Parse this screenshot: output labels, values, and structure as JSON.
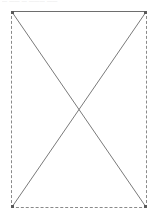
{
  "canvas": {
    "width": 156,
    "height": 218,
    "background_color": "#ffffff"
  },
  "caption": {
    "text": "—  ——  — ———  ——",
    "note_color": "#d8d8d8"
  },
  "placeholder": {
    "name": "broken-image-placeholder",
    "x": 11,
    "y": 11,
    "width": 136,
    "height": 197,
    "fill_color": "#ffffff",
    "border_color": "#8a8a8a",
    "top_border_color": "#6e6e6e",
    "border_style_sides": "dashed",
    "border_style_top": "solid",
    "diagonal_color": "#7a7a7a",
    "diagonal_width": 1,
    "corner_marker_color": "#5a5a5a",
    "diagonals": [
      {
        "name": "diagonal-tl-br",
        "x1": 0,
        "y1": 0,
        "x2": 136,
        "y2": 197
      },
      {
        "name": "diagonal-tr-bl",
        "x1": 136,
        "y1": 0,
        "x2": 0,
        "y2": 197
      }
    ],
    "crossing_point": {
      "x": 79,
      "y": 110
    }
  }
}
